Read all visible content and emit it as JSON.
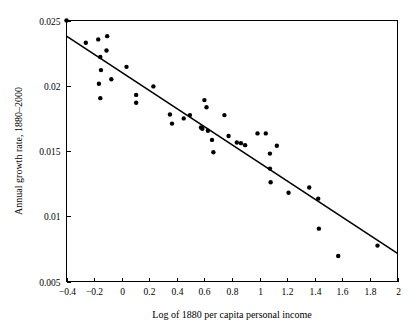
{
  "chart_data": {
    "type": "scatter",
    "title": "",
    "xlabel": "Log of 1880 per capita personal income",
    "ylabel": "Annual growth rate, 1880–2000",
    "xlim": [
      -0.4,
      2.0
    ],
    "ylim": [
      0.005,
      0.025
    ],
    "grid": false,
    "legend": null,
    "xticks": [
      -0.4,
      -0.2,
      0,
      0.2,
      0.4,
      0.6,
      0.8,
      1,
      1.2,
      1.4,
      1.6,
      1.8,
      2
    ],
    "xtick_labels": [
      "−0.4",
      "−0.2",
      "0",
      "0.2",
      "0.4",
      "0.6",
      "0.8",
      "1",
      "1.2",
      "1.4",
      "1.6",
      "1.8",
      "2"
    ],
    "yticks": [
      0.005,
      0.01,
      0.015,
      0.02,
      0.025
    ],
    "ytick_labels": [
      "0.005",
      "0.01",
      "0.015",
      "0.02",
      "0.025"
    ],
    "marker": "filled-circle",
    "marker_color": "#000000",
    "line_color": "#000000",
    "points": [
      {
        "x": -0.4,
        "y": 0.025
      },
      {
        "x": -0.26,
        "y": 0.0233
      },
      {
        "x": -0.17,
        "y": 0.02355
      },
      {
        "x": -0.155,
        "y": 0.0222
      },
      {
        "x": -0.15,
        "y": 0.0212
      },
      {
        "x": -0.165,
        "y": 0.02015
      },
      {
        "x": -0.155,
        "y": 0.01905
      },
      {
        "x": -0.105,
        "y": 0.0238
      },
      {
        "x": -0.11,
        "y": 0.0227
      },
      {
        "x": -0.075,
        "y": 0.0205
      },
      {
        "x": 0.035,
        "y": 0.02145
      },
      {
        "x": 0.105,
        "y": 0.0193
      },
      {
        "x": 0.105,
        "y": 0.0187
      },
      {
        "x": 0.23,
        "y": 0.01995
      },
      {
        "x": 0.35,
        "y": 0.0178
      },
      {
        "x": 0.365,
        "y": 0.0171
      },
      {
        "x": 0.45,
        "y": 0.0175
      },
      {
        "x": 0.495,
        "y": 0.01775
      },
      {
        "x": 0.575,
        "y": 0.0168
      },
      {
        "x": 0.585,
        "y": 0.0167
      },
      {
        "x": 0.6,
        "y": 0.0189
      },
      {
        "x": 0.615,
        "y": 0.01835
      },
      {
        "x": 0.625,
        "y": 0.01655
      },
      {
        "x": 0.655,
        "y": 0.01585
      },
      {
        "x": 0.665,
        "y": 0.0149
      },
      {
        "x": 0.745,
        "y": 0.01775
      },
      {
        "x": 0.775,
        "y": 0.01615
      },
      {
        "x": 0.835,
        "y": 0.01565
      },
      {
        "x": 0.865,
        "y": 0.0156
      },
      {
        "x": 0.895,
        "y": 0.01545
      },
      {
        "x": 0.985,
        "y": 0.01635
      },
      {
        "x": 1.045,
        "y": 0.01635
      },
      {
        "x": 1.075,
        "y": 0.0148
      },
      {
        "x": 1.075,
        "y": 0.01365
      },
      {
        "x": 1.08,
        "y": 0.0126
      },
      {
        "x": 1.125,
        "y": 0.0154
      },
      {
        "x": 1.21,
        "y": 0.0118
      },
      {
        "x": 1.36,
        "y": 0.0122
      },
      {
        "x": 1.425,
        "y": 0.01135
      },
      {
        "x": 1.43,
        "y": 0.00905
      },
      {
        "x": 1.57,
        "y": 0.00695
      },
      {
        "x": 1.855,
        "y": 0.00775
      }
    ],
    "fit_line": {
      "label": "regression-line",
      "x_start": -0.4,
      "y_start": 0.0238,
      "x_end": 2.0,
      "y_end": 0.00715
    }
  },
  "axes": {
    "x_axis_name": "x-axis",
    "y_axis_name": "y-axis"
  }
}
